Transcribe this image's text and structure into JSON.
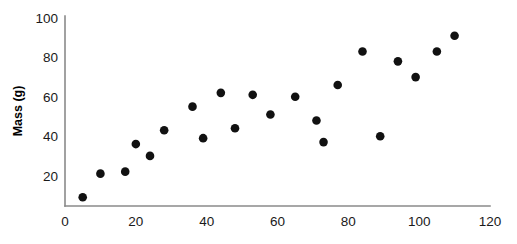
{
  "chart_data": {
    "type": "scatter",
    "title": "",
    "xlabel": "",
    "ylabel": "Mass (g)",
    "xlim": [
      0,
      120
    ],
    "ylim": [
      0,
      100
    ],
    "xticks": [
      0,
      20,
      40,
      60,
      80,
      100,
      120
    ],
    "yticks": [
      20,
      40,
      60,
      80,
      100
    ],
    "grid": false,
    "legend": null,
    "marker": "filled-circle",
    "marker_color": "#111111",
    "axis_color": "#8a8a8a",
    "background_color": "#ffffff",
    "points": [
      {
        "x": 5,
        "y": 9
      },
      {
        "x": 10,
        "y": 21
      },
      {
        "x": 17,
        "y": 22
      },
      {
        "x": 20,
        "y": 36
      },
      {
        "x": 24,
        "y": 30
      },
      {
        "x": 28,
        "y": 43
      },
      {
        "x": 36,
        "y": 55
      },
      {
        "x": 39,
        "y": 39
      },
      {
        "x": 44,
        "y": 62
      },
      {
        "x": 48,
        "y": 44
      },
      {
        "x": 53,
        "y": 61
      },
      {
        "x": 58,
        "y": 51
      },
      {
        "x": 65,
        "y": 60
      },
      {
        "x": 71,
        "y": 48
      },
      {
        "x": 73,
        "y": 37
      },
      {
        "x": 77,
        "y": 66
      },
      {
        "x": 84,
        "y": 83
      },
      {
        "x": 89,
        "y": 40
      },
      {
        "x": 94,
        "y": 78
      },
      {
        "x": 99,
        "y": 70
      },
      {
        "x": 105,
        "y": 83
      },
      {
        "x": 110,
        "y": 91
      }
    ],
    "x_tick_labels": [
      "0",
      "20",
      "40",
      "60",
      "80",
      "100",
      "120"
    ],
    "y_tick_labels": [
      "20",
      "40",
      "60",
      "80",
      "100"
    ]
  }
}
